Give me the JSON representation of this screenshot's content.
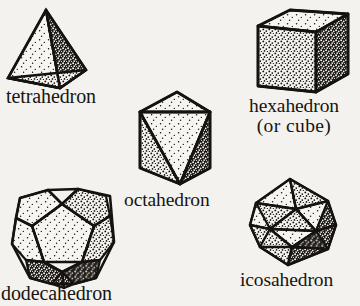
{
  "figure": {
    "background_color": "#f4f2ee",
    "ink_color": "#141210",
    "style": "stippled line-art engraving"
  },
  "captions": {
    "tetrahedron": "tetrahedron",
    "hexahedron_line1": "hexahedron",
    "hexahedron_line2": "(or  cube)",
    "octahedron": "octahedron",
    "dodecahedron": "dodecahedron",
    "icosahedron": "icosahedron"
  },
  "solids": [
    {
      "name": "tetrahedron",
      "faces": 4,
      "face_shape": "triangle",
      "shading": [
        "light-stipple",
        "dark-stipple",
        "mid-stipple"
      ],
      "position": {
        "x": 5,
        "y": 6,
        "width": 92,
        "height": 82
      }
    },
    {
      "name": "hexahedron",
      "alt_name": "cube",
      "faces": 6,
      "face_shape": "square",
      "shading": [
        "light-stipple",
        "mid-stipple",
        "dense-stipple"
      ],
      "position": {
        "x": 254,
        "y": 8,
        "width": 98,
        "height": 88
      }
    },
    {
      "name": "octahedron",
      "faces": 8,
      "face_shape": "triangle",
      "shading": [
        "light-stipple",
        "mid-stipple",
        "dense-stipple"
      ],
      "position": {
        "x": 136,
        "y": 90,
        "width": 80,
        "height": 97
      }
    },
    {
      "name": "dodecahedron",
      "faces": 12,
      "face_shape": "pentagon",
      "shading": [
        "light-stipple",
        "mid-stipple",
        "dense-stipple"
      ],
      "position": {
        "x": 11,
        "y": 186,
        "width": 104,
        "height": 98
      }
    },
    {
      "name": "icosahedron",
      "faces": 20,
      "face_shape": "triangle",
      "shading": [
        "light-stipple",
        "mid-stipple",
        "dense-stipple"
      ],
      "position": {
        "x": 247,
        "y": 177,
        "width": 90,
        "height": 93
      }
    }
  ]
}
